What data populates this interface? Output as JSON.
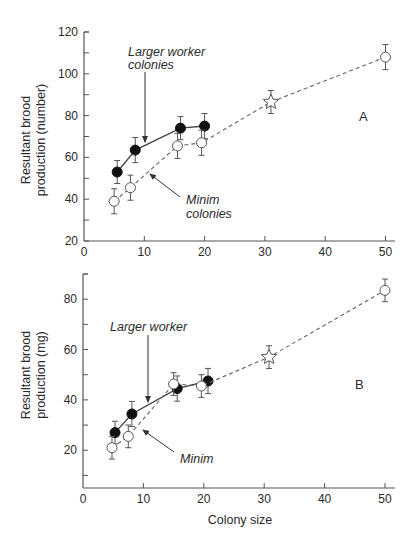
{
  "chart_data": [
    {
      "panel": "A",
      "type": "line",
      "title": "",
      "xlabel": "",
      "ylabel": "Resultant brood production (number)",
      "ylabel_lines": [
        "Resultant brood",
        "production (number)"
      ],
      "xlim": [
        0,
        52
      ],
      "ylim": [
        20,
        120
      ],
      "xticks": [
        0,
        10,
        20,
        30,
        40,
        50
      ],
      "yticks": [
        20,
        40,
        60,
        80,
        100,
        120
      ],
      "grid": false,
      "panel_label": "A",
      "series": [
        {
          "name": "Larger worker colonies",
          "style": "solid",
          "marker": "filled-circle",
          "x": [
            5.5,
            8.5,
            16,
            20
          ],
          "y": [
            53,
            63.5,
            74,
            75
          ],
          "err": [
            5.5,
            6,
            5.5,
            6
          ]
        },
        {
          "name": "Minim colonies",
          "style": "dashed",
          "marker": "open-circle",
          "x": [
            5,
            7.7,
            15.5,
            19.5,
            31,
            50
          ],
          "y": [
            39,
            45.5,
            65.5,
            67,
            86.5,
            108
          ],
          "err": [
            6,
            6,
            6,
            6,
            5.5,
            6
          ],
          "markers": [
            "circle",
            "circle",
            "circle",
            "circle",
            "star",
            "circle"
          ]
        }
      ],
      "annotations": [
        {
          "text_lines": [
            "Larger worker",
            "colonies"
          ],
          "x": 7.4,
          "y": 106,
          "arrow_to": [
            10.2,
            64
          ]
        },
        {
          "text_lines": [
            "Minim",
            "colonies"
          ],
          "x": 17,
          "y": 38.5,
          "arrow_to": [
            10.8,
            50.5
          ]
        }
      ]
    },
    {
      "panel": "B",
      "type": "line",
      "title": "",
      "xlabel": "Colony size",
      "ylabel": "Resultant brood production (mg)",
      "ylabel_lines": [
        "Resultant brood",
        "production (mg)"
      ],
      "xlim": [
        0,
        52
      ],
      "ylim": [
        5,
        90
      ],
      "xticks": [
        0,
        10,
        20,
        30,
        40,
        50
      ],
      "yticks": [
        20,
        40,
        60,
        80
      ],
      "yminor": [
        10,
        30,
        50,
        70,
        90
      ],
      "grid": false,
      "panel_label": "B",
      "series": [
        {
          "name": "Larger worker",
          "style": "solid",
          "marker": "filled-circle",
          "x": [
            5.3,
            8.1,
            15.6,
            20.7
          ],
          "y": [
            27,
            34.4,
            44.5,
            47.5
          ],
          "err": [
            4.5,
            5,
            5,
            5
          ]
        },
        {
          "name": "Minim",
          "style": "dashed",
          "marker": "open-circle",
          "x": [
            4.8,
            7.5,
            15,
            19.6,
            30.8,
            50
          ],
          "y": [
            21,
            25.5,
            46.3,
            45.5,
            57,
            83.5
          ],
          "err": [
            4.5,
            4.5,
            4.5,
            4.5,
            4.5,
            4.5
          ],
          "markers": [
            "circle",
            "circle",
            "circle",
            "circle",
            "star",
            "circle"
          ]
        }
      ],
      "annotations": [
        {
          "text_lines": [
            "Larger worker"
          ],
          "x": 4.5,
          "y": 63,
          "arrow_to": [
            10.8,
            40
          ]
        },
        {
          "text_lines": [
            "Minim"
          ],
          "x": 16,
          "y": 22,
          "arrow_to": [
            9.8,
            29
          ]
        }
      ]
    }
  ],
  "labels": {
    "panel_a": "A",
    "panel_b": "B",
    "x_axis_title": "Colony size",
    "a_ylabel_1": "Resultant brood",
    "a_ylabel_2": "production (number)",
    "b_ylabel_1": "Resultant brood",
    "b_ylabel_2": "production (mg)",
    "a_annot_larger_1": "Larger worker",
    "a_annot_larger_2": "colonies",
    "a_annot_minim_1": "Minim",
    "a_annot_minim_2": "colonies",
    "b_annot_larger": "Larger worker",
    "b_annot_minim": "Minim"
  }
}
